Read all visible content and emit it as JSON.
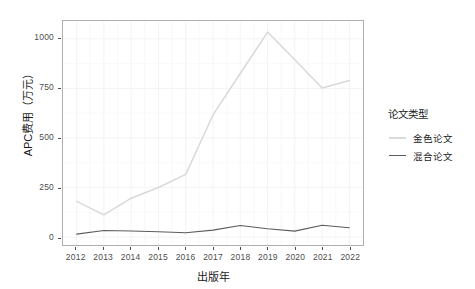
{
  "chart_data": {
    "type": "line",
    "title": "",
    "xlabel": "出版年",
    "ylabel": "APC费用（万元）",
    "x": [
      2012,
      2013,
      2014,
      2015,
      2016,
      2017,
      2018,
      2019,
      2020,
      2021,
      2022
    ],
    "xtick_labels": [
      "2012",
      "2013",
      "2014",
      "2015",
      "2016",
      "2017",
      "2018",
      "2019",
      "2020",
      "2021",
      "2022"
    ],
    "ytick_labels": [
      "0",
      "250",
      "500",
      "750",
      "1000"
    ],
    "yticks": [
      0,
      250,
      500,
      750,
      1000
    ],
    "xlim": [
      2011.5,
      2022.5
    ],
    "ylim": [
      -40,
      1090
    ],
    "grid": true,
    "legend_position": "right",
    "series": [
      {
        "name": "金色论文",
        "color": "#d9d9d9",
        "values": [
          180,
          112,
          196,
          250,
          316,
          616,
          825,
          1034,
          895,
          752,
          790
        ]
      },
      {
        "name": "混合论文",
        "color": "#5c5c5c",
        "values": [
          15,
          33,
          31,
          27,
          22,
          35,
          58,
          42,
          30,
          60,
          47
        ]
      }
    ]
  },
  "legend": {
    "title": "论文类型"
  },
  "colors": {
    "panel_border": "#b0b0b0",
    "grid_major": "#f2f2f2",
    "grid_minor": "#f7f7f7",
    "axis_text": "#4d4d4d",
    "title_text": "#1a1a1a",
    "background": "#ffffff"
  }
}
